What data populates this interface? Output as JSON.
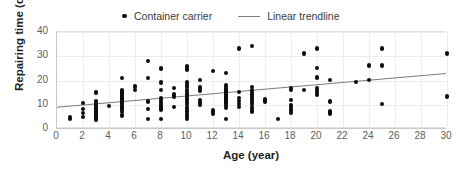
{
  "chart_data": {
    "type": "scatter",
    "title": "",
    "xlabel": "Age (year)",
    "ylabel": "Repairing time (day)",
    "xlim": [
      0,
      30
    ],
    "ylim": [
      0,
      40
    ],
    "xticks": [
      0,
      2,
      4,
      6,
      8,
      10,
      12,
      14,
      16,
      18,
      20,
      22,
      24,
      26,
      28,
      30
    ],
    "yticks": [
      0,
      10,
      20,
      30,
      40
    ],
    "grid": true,
    "legend_position": "top-center",
    "legend": [
      {
        "label": "Container carrier",
        "marker": "dot",
        "color": "#0d0d0d"
      },
      {
        "label": "Linear trendline",
        "marker": "line",
        "color": "#7d7d7d"
      }
    ],
    "series": [
      {
        "name": "Container carrier",
        "marker": "dot",
        "color": "#0d0d0d",
        "points": [
          [
            1,
            4.2
          ],
          [
            1,
            5.0
          ],
          [
            2,
            5.0
          ],
          [
            2,
            6.6
          ],
          [
            2,
            8.3
          ],
          [
            2,
            10.8
          ],
          [
            3,
            3.6
          ],
          [
            3,
            4.2
          ],
          [
            3,
            4.8
          ],
          [
            3,
            5.4
          ],
          [
            3,
            6.0
          ],
          [
            3,
            6.6
          ],
          [
            3,
            7.2
          ],
          [
            3,
            7.8
          ],
          [
            3,
            8.4
          ],
          [
            3,
            9.0
          ],
          [
            3,
            9.6
          ],
          [
            3,
            10.2
          ],
          [
            3,
            11.4
          ],
          [
            3,
            15.0
          ],
          [
            4,
            9.4
          ],
          [
            5,
            5.6
          ],
          [
            5,
            7.0
          ],
          [
            5,
            7.8
          ],
          [
            5,
            8.4
          ],
          [
            5,
            9.0
          ],
          [
            5,
            9.6
          ],
          [
            5,
            10.2
          ],
          [
            5,
            10.8
          ],
          [
            5,
            11.4
          ],
          [
            5,
            12.0
          ],
          [
            5,
            12.6
          ],
          [
            5,
            13.2
          ],
          [
            5,
            13.8
          ],
          [
            5,
            14.4
          ],
          [
            5,
            15.0
          ],
          [
            5,
            15.6
          ],
          [
            5,
            16.2
          ],
          [
            5,
            21.0
          ],
          [
            6,
            16.0
          ],
          [
            6,
            17.6
          ],
          [
            7,
            4.2
          ],
          [
            7,
            8.2
          ],
          [
            7,
            11.4
          ],
          [
            7,
            21.0
          ],
          [
            7,
            28.0
          ],
          [
            8,
            4.2
          ],
          [
            8,
            8.0
          ],
          [
            8,
            8.8
          ],
          [
            8,
            9.6
          ],
          [
            8,
            10.4
          ],
          [
            8,
            11.2
          ],
          [
            8,
            12.0
          ],
          [
            8,
            12.8
          ],
          [
            8,
            16.2
          ],
          [
            8,
            19.2
          ],
          [
            8,
            25.0
          ],
          [
            9,
            9.2
          ],
          [
            9,
            13.2
          ],
          [
            9,
            14.2
          ],
          [
            9,
            17.0
          ],
          [
            10,
            4.2
          ],
          [
            10,
            5.2
          ],
          [
            10,
            6.2
          ],
          [
            10,
            7.2
          ],
          [
            10,
            8.2
          ],
          [
            10,
            9.2
          ],
          [
            10,
            10.2
          ],
          [
            10,
            11.2
          ],
          [
            10,
            12.2
          ],
          [
            10,
            13.2
          ],
          [
            10,
            14.2
          ],
          [
            10,
            15.2
          ],
          [
            10,
            16.2
          ],
          [
            10,
            17.2
          ],
          [
            10,
            18.2
          ],
          [
            10,
            19.2
          ],
          [
            10,
            24.6
          ],
          [
            10,
            25.8
          ],
          [
            11,
            10.0
          ],
          [
            11,
            11.0
          ],
          [
            11,
            12.0
          ],
          [
            11,
            15.6
          ],
          [
            11,
            16.6
          ],
          [
            11,
            17.2
          ],
          [
            11,
            20.2
          ],
          [
            12,
            6.2
          ],
          [
            12,
            7.0
          ],
          [
            12,
            7.6
          ],
          [
            12,
            24.0
          ],
          [
            13,
            4.2
          ],
          [
            13,
            8.6
          ],
          [
            13,
            9.4
          ],
          [
            13,
            10.2
          ],
          [
            13,
            11.0
          ],
          [
            13,
            11.8
          ],
          [
            13,
            12.6
          ],
          [
            13,
            13.4
          ],
          [
            13,
            14.2
          ],
          [
            13,
            15.0
          ],
          [
            13,
            15.8
          ],
          [
            13,
            16.6
          ],
          [
            13,
            17.4
          ],
          [
            13,
            18.2
          ],
          [
            13,
            23.0
          ],
          [
            14,
            9.2
          ],
          [
            14,
            10.4
          ],
          [
            14,
            11.6
          ],
          [
            14,
            12.8
          ],
          [
            14,
            15.2
          ],
          [
            14,
            33.2
          ],
          [
            15,
            7.2
          ],
          [
            15,
            8.2
          ],
          [
            15,
            9.2
          ],
          [
            15,
            10.2
          ],
          [
            15,
            11.2
          ],
          [
            15,
            12.2
          ],
          [
            15,
            13.2
          ],
          [
            15,
            14.2
          ],
          [
            15,
            15.2
          ],
          [
            15,
            16.2
          ],
          [
            15,
            17.4
          ],
          [
            15,
            34.2
          ],
          [
            16,
            11.4
          ],
          [
            16,
            12.2
          ],
          [
            17,
            4.2
          ],
          [
            18,
            6.6
          ],
          [
            18,
            7.4
          ],
          [
            18,
            8.2
          ],
          [
            18,
            9.0
          ],
          [
            18,
            9.8
          ],
          [
            18,
            12.0
          ],
          [
            18,
            16.0
          ],
          [
            18,
            16.8
          ],
          [
            19,
            16.2
          ],
          [
            19,
            31.2
          ],
          [
            20,
            14.2
          ],
          [
            20,
            15.2
          ],
          [
            20,
            16.0
          ],
          [
            20,
            17.0
          ],
          [
            20,
            21.2
          ],
          [
            20,
            25.2
          ],
          [
            20,
            33.2
          ],
          [
            21,
            6.4
          ],
          [
            21,
            7.2
          ],
          [
            21,
            11.4
          ],
          [
            21,
            20.2
          ],
          [
            23,
            19.4
          ],
          [
            24,
            20.2
          ],
          [
            24,
            26.2
          ],
          [
            25,
            10.4
          ],
          [
            25,
            26.2
          ],
          [
            25,
            33.2
          ],
          [
            30,
            13.4
          ],
          [
            30,
            31.2
          ]
        ]
      }
    ],
    "trendline": {
      "name": "Linear trendline",
      "color": "#7d7d7d",
      "x_start": 0,
      "y_start": 8.3,
      "x_end": 30,
      "y_end": 22.5
    }
  }
}
